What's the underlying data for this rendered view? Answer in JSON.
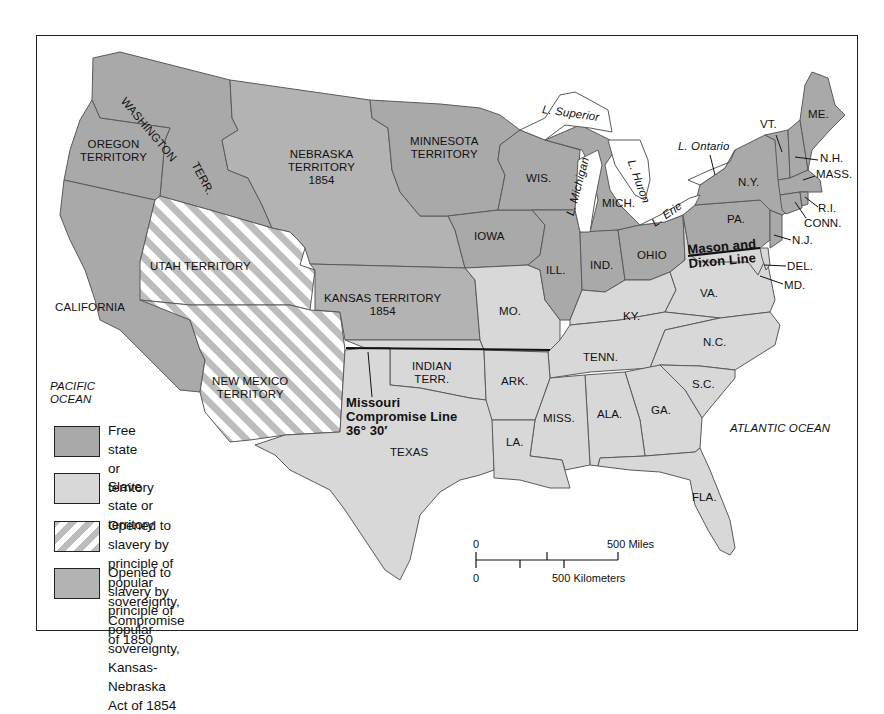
{
  "colors": {
    "free": "#a9a9a9",
    "slave": "#d8d8d8",
    "compromise_1850_stripe": "#bdbdbd",
    "kansas_nebraska_1854": "#b3b3b3",
    "water": "#ffffff",
    "border": "#555555",
    "line": "#111111"
  },
  "regions": {
    "washington": "WASHINGTON",
    "washington_terr": "TERR.",
    "oregon": "OREGON\nTERRITORY",
    "nebraska": "NEBRASKA\nTERRITORY\n1854",
    "minnesota": "MINNESOTA\nTERRITORY",
    "utah": "UTAH TERRITORY",
    "california": "CALIFORNIA",
    "kansas": "KANSAS TERRITORY\n1854",
    "new_mexico": "NEW MEXICO\nTERRITORY",
    "indian": "INDIAN\nTERR.",
    "texas": "TEXAS",
    "iowa": "IOWA",
    "wis": "WIS.",
    "mich": "MICH.",
    "ill": "ILL.",
    "ind": "IND.",
    "ohio": "OHIO",
    "mo": "MO.",
    "ky": "KY.",
    "va": "VA.",
    "pa": "PA.",
    "ny": "N.Y.",
    "vt": "VT.",
    "me": "ME.",
    "nh": "N.H.",
    "mass": "MASS.",
    "ri": "R.I.",
    "conn": "CONN.",
    "nj": "N.J.",
    "del": "DEL.",
    "md": "MD.",
    "nc": "N.C.",
    "tenn": "TENN.",
    "sc": "S.C.",
    "ark": "ARK.",
    "miss": "MISS.",
    "ala": "ALA.",
    "ga": "GA.",
    "la": "LA.",
    "fla": "FLA."
  },
  "water": {
    "superior": "L. Superior",
    "michigan": "L. Michigan",
    "huron": "L. Huron",
    "erie": "L. Erie",
    "ontario": "L. Ontario",
    "pacific": "PACIFIC\nOCEAN",
    "atlantic": "ATLANTIC OCEAN"
  },
  "annotations": {
    "mason_dixon": "Mason and\nDixon Line",
    "missouri_compromise": "Missouri\nCompromise Line\n36° 30′"
  },
  "legend": [
    {
      "key": "free",
      "label": "Free state\nor territory"
    },
    {
      "key": "slave",
      "label": "Slave state or territory"
    },
    {
      "key": "compromise_1850",
      "label": "Opened to slavery by principle of popular\nsovereignty, Compromise of 1850"
    },
    {
      "key": "kansas_nebraska_1854",
      "label": "Opened to slavery by principle of popular\nsovereignty, Kansas-Nebraska Act of 1854"
    }
  ],
  "scale": {
    "miles_zero": "0",
    "miles_label": "500 Miles",
    "km_zero": "0",
    "km_label": "500 Kilometers"
  }
}
